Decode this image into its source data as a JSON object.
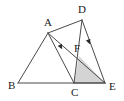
{
  "figure": {
    "canvas": {
      "width": 124,
      "height": 101,
      "background": "#ffffff"
    },
    "style": {
      "stroke_color": "#4a4a4a",
      "stroke_width": 1,
      "shade_fill": "#d4d4d4",
      "label_color": "#1a1a1a",
      "tick_color": "#2b2b2b"
    },
    "points": [
      {
        "id": "A",
        "label": "A",
        "x": 48,
        "y": 33,
        "label_x": 44,
        "label_y": 26
      },
      {
        "id": "B",
        "label": "B",
        "x": 18,
        "y": 83,
        "label_x": 8,
        "label_y": 89
      },
      {
        "id": "C",
        "label": "C",
        "x": 74,
        "y": 83,
        "label_x": 71,
        "label_y": 96
      },
      {
        "id": "D",
        "label": "D",
        "x": 82,
        "y": 20,
        "label_x": 78,
        "label_y": 13
      },
      {
        "id": "E",
        "label": "E",
        "x": 105,
        "y": 83,
        "label_x": 109,
        "label_y": 90
      },
      {
        "id": "F",
        "label": "F",
        "x": 79,
        "y": 56,
        "label_x": 74,
        "label_y": 52
      }
    ],
    "segments": [
      {
        "id": "AB",
        "from": "A",
        "to": "B"
      },
      {
        "id": "BE",
        "from": "B",
        "to": "E"
      },
      {
        "id": "AC",
        "from": "A",
        "to": "C"
      },
      {
        "id": "AD",
        "from": "A",
        "to": "D"
      },
      {
        "id": "AE",
        "from": "A",
        "to": "E"
      },
      {
        "id": "DC",
        "from": "D",
        "to": "C"
      },
      {
        "id": "DE",
        "from": "D",
        "to": "E"
      },
      {
        "id": "CE",
        "from": "C",
        "to": "E"
      }
    ],
    "shaded_regions": [
      {
        "id": "FCE",
        "vertices": [
          "F",
          "C",
          "E"
        ],
        "fill": "#d4d4d4"
      }
    ],
    "tick_marks": [
      {
        "id": "tick-ac",
        "on_segment": "AC",
        "x": 61,
        "y": 47,
        "angle": 62,
        "meaning": "parallel-mark"
      },
      {
        "id": "tick-de",
        "on_segment": "DE",
        "x": 89,
        "y": 42,
        "angle": 70,
        "meaning": "parallel-mark"
      }
    ]
  }
}
